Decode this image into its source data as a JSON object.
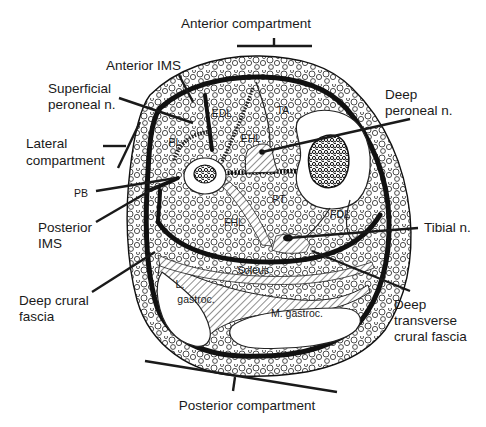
{
  "figure": {
    "colors": {
      "ink": "#1a1a1a",
      "background": "#ffffff"
    }
  },
  "compartments": {
    "anterior": {
      "label": "Anterior compartment",
      "x": 246,
      "y": 28
    },
    "lateral": {
      "line1": "Lateral",
      "line2": "compartment",
      "x": 26,
      "y": 148
    },
    "posterior": {
      "label": "Posterior compartment",
      "x": 247,
      "y": 410
    }
  },
  "callouts": [
    {
      "id": "anterior-ims",
      "lines": [
        "Anterior IMS"
      ],
      "x": 106,
      "y": 70,
      "anchor": "start"
    },
    {
      "id": "superficial-peroneal-n",
      "lines": [
        "Superficial",
        "peroneal n."
      ],
      "x": 48,
      "y": 93,
      "anchor": "start"
    },
    {
      "id": "deep-peroneal-n",
      "lines": [
        "Deep",
        "peroneal n."
      ],
      "x": 385,
      "y": 99,
      "anchor": "start"
    },
    {
      "id": "pb",
      "lines": [
        "PB"
      ],
      "x": 74,
      "y": 197,
      "anchor": "start"
    },
    {
      "id": "posterior-ims",
      "lines": [
        "Posterior",
        "IMS"
      ],
      "x": 38,
      "y": 232,
      "anchor": "start"
    },
    {
      "id": "tibial-n",
      "lines": [
        "Tibial n."
      ],
      "x": 424,
      "y": 232,
      "anchor": "start"
    },
    {
      "id": "deep-crural-fascia",
      "lines": [
        "Deep crural",
        "fascia"
      ],
      "x": 19,
      "y": 305,
      "anchor": "start"
    },
    {
      "id": "deep-transverse-crural-fascia",
      "lines": [
        "Deep",
        "transverse",
        "crural fascia"
      ],
      "x": 394,
      "y": 309,
      "anchor": "start"
    }
  ],
  "muscles": [
    {
      "id": "edl",
      "label": "EDL",
      "x": 222,
      "y": 117
    },
    {
      "id": "ta",
      "label": "TA",
      "x": 283,
      "y": 114
    },
    {
      "id": "ehl",
      "label": "EHL",
      "x": 251,
      "y": 142
    },
    {
      "id": "pl",
      "label": "PL",
      "x": 175,
      "y": 146
    },
    {
      "id": "pt",
      "label": "PT",
      "x": 279,
      "y": 203
    },
    {
      "id": "fhl",
      "label": "FHL",
      "x": 234,
      "y": 226
    },
    {
      "id": "fdl",
      "label": "FDL",
      "x": 340,
      "y": 218
    },
    {
      "id": "soleus",
      "label": "Soleus",
      "x": 253,
      "y": 274
    },
    {
      "id": "l-gastroc-1",
      "label": "L.",
      "x": 180,
      "y": 288
    },
    {
      "id": "l-gastroc-2",
      "label": "gastroc.",
      "x": 196,
      "y": 303
    },
    {
      "id": "m-gastroc",
      "label": "M. gastroc.",
      "x": 297,
      "y": 317
    }
  ]
}
